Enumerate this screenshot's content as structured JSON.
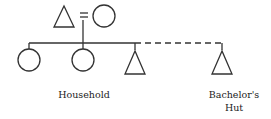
{
  "diagram": {
    "type": "kinship",
    "stroke_color": "#333333",
    "parents": [
      {
        "symbol": "triangle",
        "meaning": "male"
      },
      {
        "symbol": "circle",
        "meaning": "female"
      }
    ],
    "marriage_symbol": "=",
    "children": [
      {
        "symbol": "circle",
        "meaning": "female",
        "group": "household"
      },
      {
        "symbol": "circle",
        "meaning": "female",
        "group": "household"
      },
      {
        "symbol": "triangle",
        "meaning": "male",
        "group": "household"
      },
      {
        "symbol": "triangle",
        "meaning": "male",
        "group": "bachelors-hut",
        "link": "dashed"
      }
    ],
    "labels": {
      "household": "Household",
      "bachelors_hut_line1": "Bachelor's",
      "bachelors_hut_line2": "Hut"
    }
  }
}
